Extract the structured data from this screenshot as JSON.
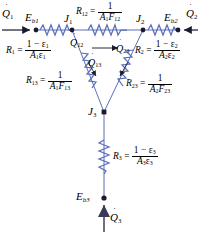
{
  "figure": {
    "type": "thermal-radiation-resistance-network",
    "wire_color": "#6b7fc4",
    "line_color": "#5b6fb8",
    "node_color": "#1a1a2e",
    "text_color": "#000000"
  },
  "nodes": [
    {
      "id": "eb1",
      "label": "E",
      "sub": "b1",
      "x": 36,
      "y": 30
    },
    {
      "id": "j1",
      "label": "J",
      "sub": "1",
      "x": 72,
      "y": 30
    },
    {
      "id": "j2",
      "label": "J",
      "sub": "2",
      "x": 143,
      "y": 30
    },
    {
      "id": "eb2",
      "label": "E",
      "sub": "b2",
      "x": 178,
      "y": 30
    },
    {
      "id": "j3",
      "label": "J",
      "sub": "3",
      "x": 104,
      "y": 112
    },
    {
      "id": "eb3",
      "label": "E",
      "sub": "b3",
      "x": 104,
      "y": 198
    }
  ],
  "fluxes": {
    "q1": {
      "base": "Q",
      "sub": "1",
      "dot": true
    },
    "q2": {
      "base": "Q",
      "sub": "2",
      "dot": true
    },
    "q3": {
      "base": "Q",
      "sub": "3",
      "dot": true
    },
    "q12": {
      "base": "Q",
      "sub": "12",
      "dot": true
    },
    "q23": {
      "base": "Q",
      "sub": "23",
      "dot": true
    },
    "q13": {
      "base": "Q",
      "sub": "13",
      "dot": true
    }
  },
  "resistances": [
    {
      "id": "r1",
      "name": "R",
      "name_sub": "1",
      "numerator": "1 − ε",
      "numerator_sub": "1",
      "denominator": "A",
      "denominator_sub": "1",
      "denominator2": "ε",
      "denominator2_sub": "1",
      "formula": "R1 = (1 - e1)/(A1 e1)"
    },
    {
      "id": "r2",
      "name": "R",
      "name_sub": "2",
      "numerator": "1 − ε",
      "numerator_sub": "2",
      "denominator": "A",
      "denominator_sub": "2",
      "denominator2": "ε",
      "denominator2_sub": "2",
      "formula": "R2 = (1 - e2)/(A2 e2)"
    },
    {
      "id": "r3",
      "name": "R",
      "name_sub": "3",
      "numerator": "1 − ε",
      "numerator_sub": "3",
      "denominator": "A",
      "denominator_sub": "3",
      "denominator2": "ε",
      "denominator2_sub": "3",
      "formula": "R3 = (1 - e3)/(A3 e3)"
    },
    {
      "id": "r12",
      "name": "R",
      "name_sub": "12",
      "numerator": "1",
      "numerator_sub": "",
      "denominator": "A",
      "denominator_sub": "1",
      "denominator2": "F",
      "denominator2_sub": "12",
      "formula": "R12 = 1/(A1 F12)"
    },
    {
      "id": "r13",
      "name": "R",
      "name_sub": "13",
      "numerator": "1",
      "numerator_sub": "",
      "denominator": "A",
      "denominator_sub": "1",
      "denominator2": "F",
      "denominator2_sub": "13",
      "formula": "R13 = 1/(A1 F13)"
    },
    {
      "id": "r23",
      "name": "R",
      "name_sub": "23",
      "numerator": "1",
      "numerator_sub": "",
      "denominator": "A",
      "denominator_sub": "2",
      "denominator2": "F",
      "denominator2_sub": "23",
      "formula": "R23 = 1/(A2 F23)"
    }
  ],
  "symbols": {
    "equals": "=",
    "minus": "−",
    "epsilon": "ε"
  }
}
